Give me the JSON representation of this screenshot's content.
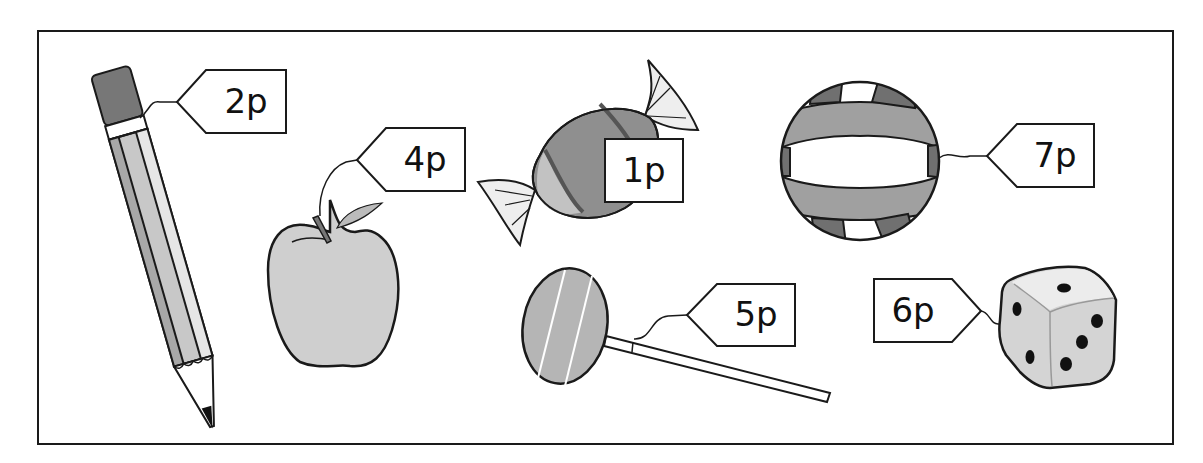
{
  "colors": {
    "outline": "#1a1a1a",
    "light_grey": "#d0d0d0",
    "mid_grey": "#b0b0b0",
    "dark_grey": "#808080",
    "darker_grey": "#555555",
    "white": "#ffffff"
  },
  "items": [
    {
      "name": "pencil",
      "price": "2p"
    },
    {
      "name": "apple",
      "price": "4p"
    },
    {
      "name": "sweet",
      "price": "1p"
    },
    {
      "name": "ball",
      "price": "7p"
    },
    {
      "name": "lollipop",
      "price": "5p"
    },
    {
      "name": "dice",
      "price": "6p"
    }
  ]
}
